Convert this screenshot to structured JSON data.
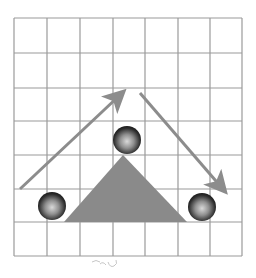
{
  "diagram": {
    "grid": {
      "columns": 7,
      "rows": 7,
      "x_lines": [
        14,
        47,
        80,
        113,
        145,
        178,
        210,
        242
      ],
      "y_lines": [
        18,
        53,
        88,
        121,
        155,
        189,
        222,
        256
      ],
      "line_color": "#9a9a9a"
    },
    "triangle": {
      "points": "64,222 123,155 187,222",
      "fill": "#8a8a8a"
    },
    "balls": [
      {
        "id": "ball-left",
        "cx": 52,
        "cy": 206,
        "r": 14
      },
      {
        "id": "ball-top",
        "cx": 127,
        "cy": 140,
        "r": 14
      },
      {
        "id": "ball-right",
        "cx": 202,
        "cy": 207,
        "r": 14
      }
    ],
    "arrows": [
      {
        "id": "arrow-up",
        "x1": 20,
        "y1": 189,
        "x2": 120,
        "y2": 95
      },
      {
        "id": "arrow-down",
        "x1": 140,
        "y1": 93,
        "x2": 222,
        "y2": 188
      }
    ],
    "arrow_color": "#8c8c8c",
    "caption_scribble": ""
  }
}
